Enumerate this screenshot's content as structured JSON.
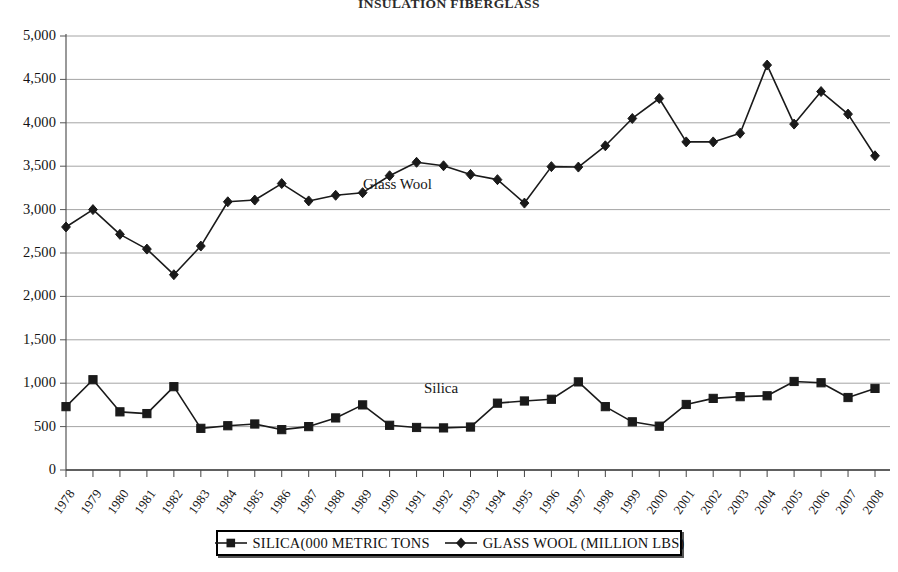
{
  "chart_data": {
    "type": "line",
    "title": "INSULATION FIBERGLASS",
    "xlabel": "",
    "ylabel": "",
    "ylim": [
      0,
      5000
    ],
    "ytick_step": 500,
    "grid": true,
    "legend_position": "bottom",
    "ytick_labels": [
      "0",
      "500",
      "1,000",
      "1,500",
      "2,000",
      "2,500",
      "3,000",
      "3,500",
      "4,000",
      "4,500",
      "5,000"
    ],
    "categories": [
      "1978",
      "1979",
      "1980",
      "1981",
      "1982",
      "1983",
      "1984",
      "1985",
      "1986",
      "1987",
      "1988",
      "1989",
      "1990",
      "1991",
      "1992",
      "1993",
      "1994",
      "1995",
      "1996",
      "1997",
      "1998",
      "1999",
      "2000",
      "2001",
      "2002",
      "2003",
      "2004",
      "2005",
      "2006",
      "2007",
      "2008"
    ],
    "series": [
      {
        "name": "SILICA(000 METRIC TONS",
        "marker": "square",
        "annotation": "Silica",
        "values": [
          730,
          1040,
          670,
          650,
          960,
          480,
          510,
          530,
          465,
          500,
          600,
          750,
          515,
          490,
          485,
          495,
          770,
          795,
          815,
          1015,
          730,
          555,
          505,
          755,
          825,
          845,
          855,
          1020,
          1005,
          835,
          940
        ]
      },
      {
        "name": "GLASS WOOL (MILLION LBS)",
        "marker": "diamond",
        "annotation": "Glass Wool",
        "values": [
          2800,
          3000,
          2715,
          2545,
          2250,
          2580,
          3090,
          3110,
          3300,
          3100,
          3165,
          3195,
          3390,
          3545,
          3505,
          3405,
          3345,
          3075,
          3495,
          3490,
          3735,
          4050,
          4280,
          3780,
          3780,
          3880,
          4665,
          3985,
          4360,
          4100,
          3620
        ]
      }
    ]
  },
  "legend": {
    "entries": [
      {
        "label": "SILICA(000 METRIC TONS",
        "marker": "square"
      },
      {
        "label": "GLASS WOOL (MILLION LBS)",
        "marker": "diamond"
      }
    ]
  },
  "annotations": {
    "glass_wool": "Glass Wool",
    "silica": "Silica"
  },
  "colors": {
    "line": "#1a1a1a",
    "grid": "#9a9a9a",
    "axis": "#555555",
    "text": "#141414"
  }
}
